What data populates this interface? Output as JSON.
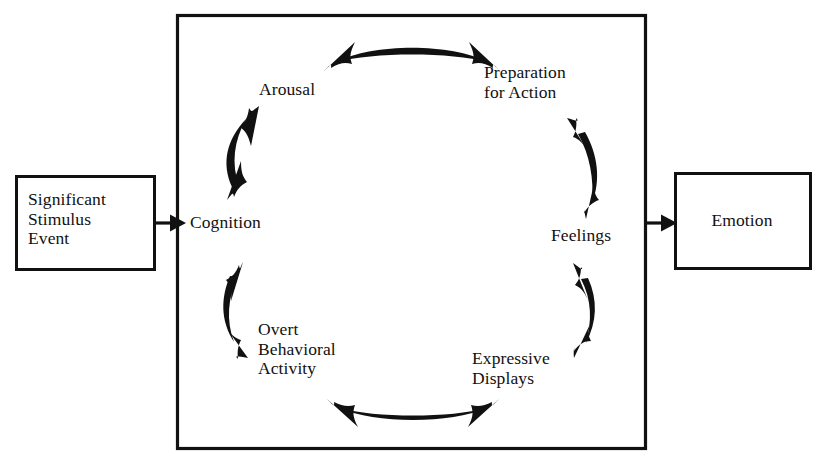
{
  "diagram": {
    "title_visible": false,
    "background_color": "#ffffff",
    "line_color": "#111111",
    "input_box": {
      "label": "Significant\nStimulus\nEvent",
      "shape": "rectangle"
    },
    "output_box": {
      "label": "Emotion",
      "shape": "rectangle"
    },
    "frame": {
      "name": "emotion-process-frame",
      "shape": "rectangle"
    },
    "connectors": [
      {
        "name": "input-to-cycle-arrow",
        "from": "Significant Stimulus Event",
        "to": "Cognition",
        "style": "straight-single-headed",
        "direction": "right"
      },
      {
        "name": "cycle-to-output-arrow",
        "from": "Feelings",
        "to": "Emotion",
        "style": "straight-single-headed",
        "direction": "right"
      }
    ],
    "cycle_nodes": [
      {
        "id": "cognition",
        "label": "Cognition"
      },
      {
        "id": "arousal",
        "label": "Arousal"
      },
      {
        "id": "preparation",
        "label": "Preparation\nfor Action"
      },
      {
        "id": "feelings",
        "label": "Feelings"
      },
      {
        "id": "expressive",
        "label": "Expressive\nDisplays"
      },
      {
        "id": "overt",
        "label": "Overt\nBehavioral\nActivity"
      }
    ],
    "cycle_arrows": [
      {
        "name": "cognition-arousal-arrow",
        "between": [
          "Cognition",
          "Arousal"
        ],
        "style": "curved-double-headed"
      },
      {
        "name": "arousal-preparation-arrow",
        "between": [
          "Arousal",
          "Preparation for Action"
        ],
        "style": "curved-double-headed"
      },
      {
        "name": "preparation-feelings-arrow",
        "between": [
          "Preparation for Action",
          "Feelings"
        ],
        "style": "curved-double-headed"
      },
      {
        "name": "feelings-expressive-arrow",
        "between": [
          "Feelings",
          "Expressive Displays"
        ],
        "style": "curved-double-headed"
      },
      {
        "name": "expressive-overt-arrow",
        "between": [
          "Expressive Displays",
          "Overt Behavioral Activity"
        ],
        "style": "curved-double-headed"
      },
      {
        "name": "overt-cognition-arrow",
        "between": [
          "Overt Behavioral Activity",
          "Cognition"
        ],
        "style": "curved-double-headed"
      }
    ]
  }
}
